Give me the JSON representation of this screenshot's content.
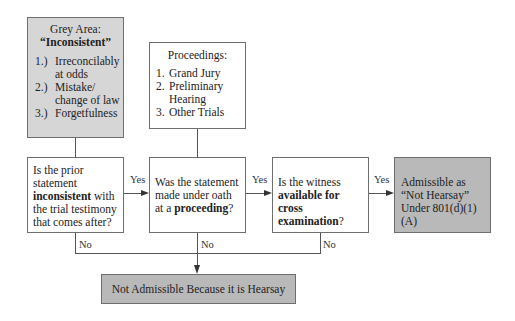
{
  "grey_area": {
    "title": "Grey Area:",
    "subtitle": "“Inconsistent”",
    "items": [
      {
        "num": "1.)",
        "text": "Irreconcilably at odds"
      },
      {
        "num": "2.)",
        "text": "Mistake/ change of law"
      },
      {
        "num": "3.)",
        "text": "Forgetfulness"
      }
    ]
  },
  "proceedings": {
    "title": "Proceedings:",
    "items": [
      {
        "num": "1.",
        "text": "Grand Jury"
      },
      {
        "num": "2.",
        "text": "Preliminary Hearing"
      },
      {
        "num": "3.",
        "text": "Other Trials"
      }
    ]
  },
  "q1": {
    "pre": "Is the prior statement ",
    "bold": "inconsistent",
    "post": " with the trial testimony that comes after?"
  },
  "q2": {
    "pre": "Was the statement made under oath at a ",
    "bold": "proceeding",
    "post": "?"
  },
  "q3": {
    "pre": "Is the witness ",
    "bold": "available for cross examination",
    "post": "?"
  },
  "outcome_yes": "Admissible as “Not Hearsay” Under 801(d)(1)(A)",
  "outcome_no": "Not Admissible Because it is Hearsay",
  "labels": {
    "yes": "Yes",
    "no": "No"
  },
  "colors": {
    "grey_box": "#d6d6d6",
    "dark_grey_box": "#b9b9b9",
    "border": "#6e6e6e"
  }
}
